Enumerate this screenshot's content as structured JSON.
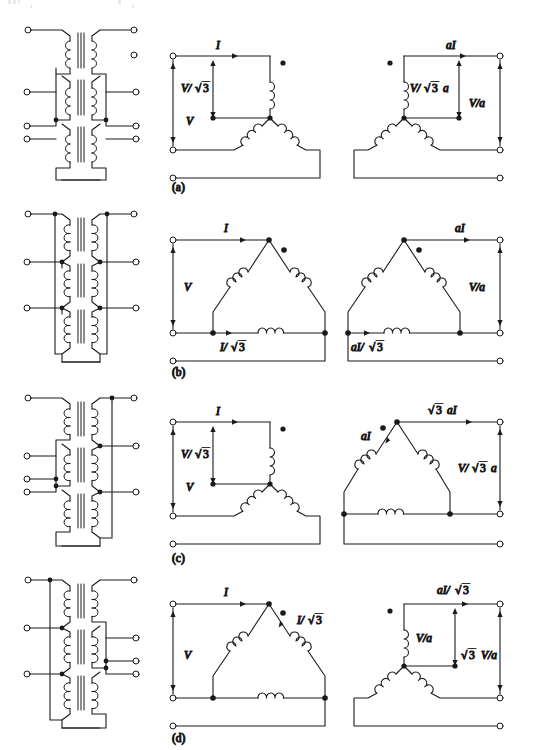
{
  "figure": {
    "stroke_color": "#1a1a1a",
    "background_color": "#ffffff",
    "node_fill": "#1a1a1a",
    "terminal_fill": "#ffffff"
  },
  "symbols": {
    "sqrt3": "√3",
    "radical": "√",
    "three": "3",
    "dot": "•"
  },
  "panels": [
    {
      "id": "a",
      "caption": "(a)",
      "connection": "Y-Y",
      "primary": {
        "winding": "wye",
        "labels": {
          "line_current": "I",
          "phase_voltage": "V/√3",
          "line_voltage": "V"
        }
      },
      "secondary": {
        "winding": "wye",
        "labels": {
          "line_current": "aI",
          "phase_voltage": "V/√3 a",
          "line_voltage": "V/a"
        }
      }
    },
    {
      "id": "b",
      "caption": "(b)",
      "connection": "Delta-Delta",
      "primary": {
        "winding": "delta",
        "labels": {
          "line_current": "I",
          "phase_current": "I/√3",
          "line_voltage": "V"
        }
      },
      "secondary": {
        "winding": "delta",
        "labels": {
          "line_current": "aI",
          "phase_current": "aI/√3",
          "line_voltage": "V/a"
        }
      }
    },
    {
      "id": "c",
      "caption": "(c)",
      "connection": "Y-Delta",
      "primary": {
        "winding": "wye",
        "labels": {
          "line_current": "I",
          "phase_voltage": "V/√3",
          "line_voltage": "V"
        }
      },
      "secondary": {
        "winding": "delta",
        "labels": {
          "line_current": "√3 aI",
          "phase_current": "aI",
          "line_voltage": "V/√3 a"
        }
      }
    },
    {
      "id": "d",
      "caption": "(d)",
      "connection": "Delta-Y",
      "primary": {
        "winding": "delta",
        "labels": {
          "line_current": "I",
          "phase_current": "I/√3",
          "line_voltage": "V"
        }
      },
      "secondary": {
        "winding": "wye",
        "labels": {
          "line_current": "aI/√3",
          "phase_voltage": "V/a",
          "line_voltage": "√3 V/a"
        }
      }
    }
  ]
}
